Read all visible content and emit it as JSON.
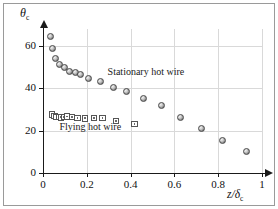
{
  "chart_data": {
    "type": "scatter",
    "title": "",
    "xlabel": "z/δc",
    "xlabel_main": "z/δ",
    "xlabel_sub": "c",
    "ylabel": "θc",
    "ylabel_main": "θ",
    "ylabel_sub": "c",
    "xlim": [
      0,
      1
    ],
    "ylim": [
      0,
      68
    ],
    "grid": true,
    "legend_position": "inline-annotations",
    "xticks": [
      0,
      0.2,
      0.4,
      0.6,
      0.8,
      1
    ],
    "xticklabels": [
      "0",
      "0.2",
      "0.4",
      "0.6",
      "0.8",
      "1"
    ],
    "yticks": [
      0,
      20,
      40,
      60
    ],
    "yticklabels": [
      "0",
      "20",
      "40",
      "60"
    ],
    "annotations": [
      {
        "text": "Stationary hot wire",
        "x": 0.295,
        "y": 47.5
      },
      {
        "text": "Flying hot wire",
        "x": 0.075,
        "y": 21.5
      }
    ],
    "series": [
      {
        "name": "Stationary hot wire",
        "marker": "circle",
        "points": [
          {
            "x": 0.032,
            "y": 64.3
          },
          {
            "x": 0.043,
            "y": 58.8
          },
          {
            "x": 0.058,
            "y": 54.0
          },
          {
            "x": 0.075,
            "y": 51.3
          },
          {
            "x": 0.096,
            "y": 49.6
          },
          {
            "x": 0.122,
            "y": 48.0
          },
          {
            "x": 0.148,
            "y": 47.6
          },
          {
            "x": 0.172,
            "y": 46.4
          },
          {
            "x": 0.208,
            "y": 44.8
          },
          {
            "x": 0.262,
            "y": 43.2
          },
          {
            "x": 0.323,
            "y": 40.5
          },
          {
            "x": 0.382,
            "y": 38.6
          },
          {
            "x": 0.458,
            "y": 35.4
          },
          {
            "x": 0.54,
            "y": 31.7
          },
          {
            "x": 0.628,
            "y": 26.4
          },
          {
            "x": 0.722,
            "y": 21.1
          },
          {
            "x": 0.818,
            "y": 15.4
          },
          {
            "x": 0.928,
            "y": 10.1
          }
        ]
      },
      {
        "name": "Flying hot wire",
        "marker": "square",
        "points": [
          {
            "x": 0.041,
            "y": 27.6
          },
          {
            "x": 0.052,
            "y": 27.0
          },
          {
            "x": 0.062,
            "y": 26.5
          },
          {
            "x": 0.072,
            "y": 26.4
          },
          {
            "x": 0.083,
            "y": 26.3
          },
          {
            "x": 0.095,
            "y": 26.4
          },
          {
            "x": 0.11,
            "y": 26.6
          },
          {
            "x": 0.132,
            "y": 26.5
          },
          {
            "x": 0.158,
            "y": 26.0
          },
          {
            "x": 0.192,
            "y": 25.8
          },
          {
            "x": 0.232,
            "y": 25.9
          },
          {
            "x": 0.272,
            "y": 25.9
          },
          {
            "x": 0.333,
            "y": 24.6
          },
          {
            "x": 0.418,
            "y": 23.0
          }
        ]
      }
    ]
  }
}
